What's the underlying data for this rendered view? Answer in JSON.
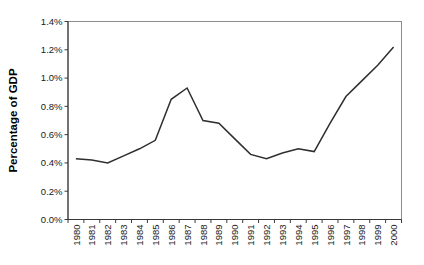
{
  "chart_data": {
    "type": "line",
    "title": "",
    "xlabel": "",
    "ylabel": "Percentage of GDP",
    "categories": [
      "1980",
      "1981",
      "1982",
      "1983",
      "1984",
      "1985",
      "1986",
      "1987",
      "1988",
      "1989",
      "1990",
      "1991",
      "1992",
      "1993",
      "1994",
      "1995",
      "1996",
      "1997",
      "1998",
      "1999",
      "2000"
    ],
    "series": [
      {
        "name": "Percentage of GDP",
        "values": [
          0.43,
          0.42,
          0.4,
          0.45,
          0.5,
          0.56,
          0.85,
          0.93,
          0.7,
          0.68,
          0.57,
          0.46,
          0.43,
          0.47,
          0.5,
          0.48,
          0.68,
          0.87,
          0.98,
          1.09,
          1.22
        ]
      }
    ],
    "ylim": [
      0.0,
      1.4
    ],
    "ytick_step": 0.2,
    "ytick_labels": [
      "0.0%",
      "0.2%",
      "0.4%",
      "0.6%",
      "0.8%",
      "1.0%",
      "1.2%",
      "1.4%"
    ],
    "grid": false,
    "legend": false,
    "x_tick_style": "between-categories",
    "x_label_rotation_deg": -90,
    "colors": {
      "line": "#2e2e2e",
      "plot_border": "#8c8c8c",
      "axis": "#3a3a3a",
      "text": "#1a1a1a",
      "background": "#ffffff"
    }
  }
}
